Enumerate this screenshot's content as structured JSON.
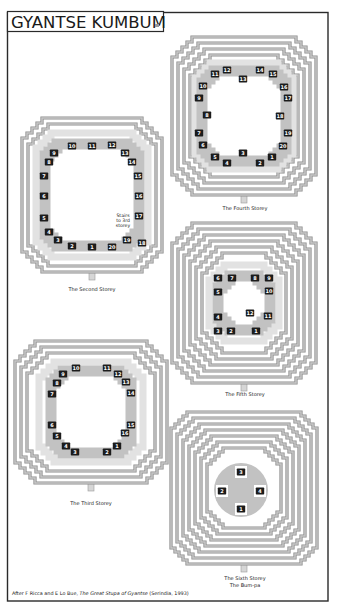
{
  "title": "GYANTSE KUMBUM",
  "map_mark": "map-code-mark",
  "colors": {
    "frame": "#2a2a2a",
    "ring_edge": "#8e8e8e",
    "ring_fill": "#c8c8c8",
    "chapel_band": "#c2c2c2",
    "chapel_light": "#e2e2e2",
    "label_box": "#1c1c1c",
    "label_text": "#ffffff"
  },
  "storeys": [
    {
      "id": "second",
      "caption": "The Second Storey",
      "labels": [
        [
          10,
          72,
          146
        ],
        [
          11,
          92,
          146
        ],
        [
          12,
          112,
          145
        ],
        [
          13,
          125,
          153
        ],
        [
          14,
          132,
          162
        ],
        [
          15,
          138,
          176
        ],
        [
          16,
          139,
          196
        ],
        [
          17,
          139,
          216
        ],
        [
          18,
          142,
          243
        ],
        [
          19,
          127,
          240
        ],
        [
          20,
          112,
          247
        ],
        [
          1,
          92,
          247
        ],
        [
          2,
          72,
          246
        ],
        [
          3,
          58,
          240
        ],
        [
          4,
          49,
          232
        ],
        [
          5,
          44,
          218
        ],
        [
          6,
          44,
          196
        ],
        [
          7,
          44,
          176
        ],
        [
          8,
          49,
          162
        ],
        [
          9,
          54,
          153
        ]
      ]
    },
    {
      "id": "fourth",
      "caption": "The Fourth Storey",
      "labels": [
        [
          11,
          215,
          74
        ],
        [
          12,
          227,
          70
        ],
        [
          13,
          243,
          79
        ],
        [
          14,
          260,
          70
        ],
        [
          15,
          273,
          74
        ],
        [
          16,
          284,
          87
        ],
        [
          17,
          288,
          98
        ],
        [
          18,
          280,
          116
        ],
        [
          19,
          288,
          133
        ],
        [
          20,
          283,
          146
        ],
        [
          1,
          272,
          157
        ],
        [
          2,
          260,
          163
        ],
        [
          3,
          243,
          153
        ],
        [
          4,
          227,
          163
        ],
        [
          5,
          215,
          157
        ],
        [
          6,
          203,
          145
        ],
        [
          7,
          199,
          133
        ],
        [
          8,
          207,
          115
        ],
        [
          9,
          199,
          98
        ],
        [
          10,
          203,
          86
        ]
      ]
    },
    {
      "id": "fifth",
      "caption": "The Fifth Storey",
      "labels": [
        [
          6,
          218,
          278
        ],
        [
          7,
          232,
          278
        ],
        [
          8,
          255,
          278
        ],
        [
          9,
          269,
          278
        ],
        [
          10,
          269,
          291
        ],
        [
          5,
          218,
          292
        ],
        [
          4,
          218,
          317
        ],
        [
          12,
          250,
          313
        ],
        [
          11,
          268,
          316
        ],
        [
          3,
          218,
          331
        ],
        [
          2,
          231,
          331
        ],
        [
          1,
          256,
          331
        ]
      ]
    },
    {
      "id": "third",
      "caption": "The Third Storey",
      "labels": [
        [
          10,
          76,
          368
        ],
        [
          11,
          107,
          368
        ],
        [
          12,
          118,
          374
        ],
        [
          13,
          126,
          382
        ],
        [
          14,
          131,
          393
        ],
        [
          15,
          131,
          425
        ],
        [
          16,
          125,
          433
        ],
        [
          1,
          117,
          446
        ],
        [
          2,
          107,
          452
        ],
        [
          3,
          75,
          452
        ],
        [
          4,
          66,
          446
        ],
        [
          5,
          57,
          436
        ],
        [
          6,
          52,
          425
        ],
        [
          7,
          52,
          394
        ],
        [
          8,
          57,
          383
        ],
        [
          9,
          63,
          374
        ]
      ]
    },
    {
      "id": "sixth",
      "caption": "The Sixth Storey",
      "subcaption": "The Bum-pa",
      "labels": [
        [
          3,
          241,
          472
        ],
        [
          2,
          222,
          491
        ],
        [
          4,
          260,
          491
        ],
        [
          1,
          241,
          509
        ]
      ]
    }
  ],
  "stairs_note": {
    "line1": "Stairs",
    "line2": "to 3rd",
    "line3": "storey"
  },
  "footer": {
    "prefix": "After F Ricca and E Lo Bue, ",
    "book_title": "The Great Stupa of Gyantse",
    "suffix": " (Serindia, 1993)"
  }
}
